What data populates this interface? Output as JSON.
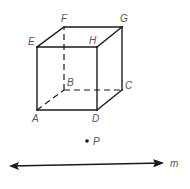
{
  "figure": {
    "vertices": {
      "A": {
        "label": "A",
        "x": 37,
        "y": 110
      },
      "B": {
        "label": "B",
        "x": 64,
        "y": 90
      },
      "C": {
        "label": "C",
        "x": 122,
        "y": 90
      },
      "D": {
        "label": "D",
        "x": 97,
        "y": 110
      },
      "E": {
        "label": "E",
        "x": 37,
        "y": 47
      },
      "F": {
        "label": "F",
        "x": 64,
        "y": 27
      },
      "G": {
        "label": "G",
        "x": 122,
        "y": 27
      },
      "H": {
        "label": "H",
        "x": 97,
        "y": 47
      }
    },
    "visible_edges": [
      "AD",
      "DC",
      "CG",
      "GF",
      "FE",
      "EA",
      "EH",
      "HD",
      "HG"
    ],
    "hidden_edges": [
      "AB",
      "BC",
      "BF"
    ],
    "point": {
      "label": "P",
      "x": 87,
      "y": 141
    },
    "line": {
      "label": "m",
      "x1": 9,
      "y1": 166,
      "x2": 164,
      "y2": 163,
      "arrows": "both"
    }
  }
}
